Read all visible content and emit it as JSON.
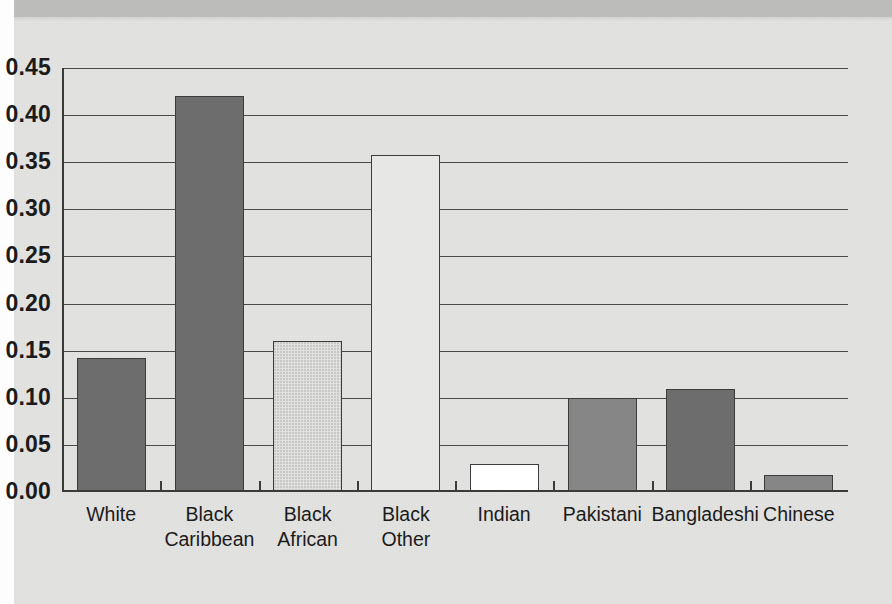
{
  "chart_data": {
    "type": "bar",
    "title": "",
    "xlabel": "",
    "ylabel": "",
    "ylim": [
      0.0,
      0.45
    ],
    "grid": true,
    "legend": "none",
    "ytick_labels": [
      "0.00",
      "0.05",
      "0.10",
      "0.15",
      "0.20",
      "0.25",
      "0.30",
      "0.35",
      "0.40",
      "0.45"
    ],
    "ytick_values": [
      0.0,
      0.05,
      0.1,
      0.15,
      0.2,
      0.25,
      0.3,
      0.35,
      0.4,
      0.45
    ],
    "categories": [
      "White",
      "Black\nCaribbean",
      "Black\nAfrican",
      "Black\nOther",
      "Indian",
      "Pakistani",
      "Bangladeshi",
      "Chinese"
    ],
    "values": [
      0.142,
      0.42,
      0.16,
      0.358,
      0.03,
      0.1,
      0.109,
      0.018
    ],
    "bar_styles": [
      "dark-grey",
      "dark-grey",
      "stippled",
      "plain-light",
      "white",
      "mid-grey",
      "dark-grey",
      "mid-grey"
    ]
  },
  "colors": {
    "page_background": "#e3e3e1",
    "top_band": "#bcbcba",
    "axis": "#3a3a3a",
    "gridline": "#4a4a4a",
    "bar_dark": "#6d6d6d",
    "bar_mid": "#868686",
    "bar_white": "#ffffff",
    "bar_plain": "#e7e7e5",
    "text": "#1b1b1b"
  }
}
